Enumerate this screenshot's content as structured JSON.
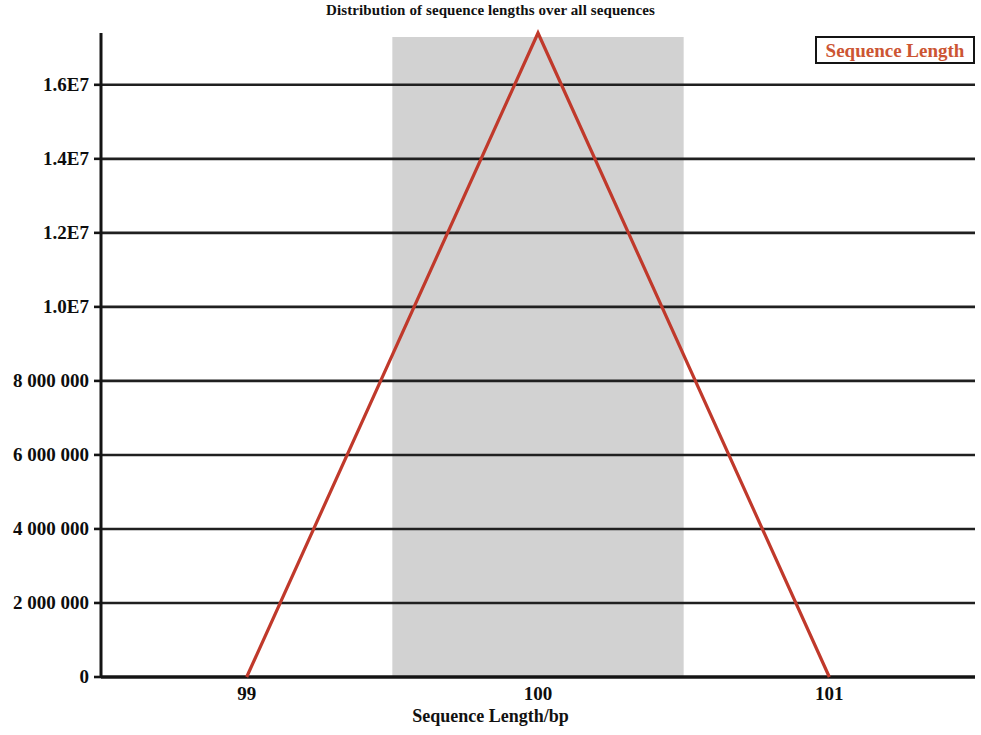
{
  "chart_data": {
    "type": "line",
    "title": "Distribution of sequence lengths over all sequences",
    "xlabel": "Sequence Length/bp",
    "ylabel": "",
    "xlim": [
      98.5,
      101.5
    ],
    "ylim": [
      0,
      17400000
    ],
    "grid": true,
    "legend_position": "top-right",
    "series": [
      {
        "name": "Sequence Length",
        "color": "#c0392b",
        "x": [
          99.0,
          100.0,
          101.0
        ],
        "values": [
          0,
          17400000,
          0
        ]
      }
    ],
    "x_ticks": [
      {
        "value": 99,
        "label": "99"
      },
      {
        "value": 100,
        "label": "100"
      },
      {
        "value": 101,
        "label": "101"
      }
    ],
    "y_ticks": [
      {
        "value": 16000000,
        "label": "1.6E7"
      },
      {
        "value": 14000000,
        "label": "1.4E7"
      },
      {
        "value": 12000000,
        "label": "1.2E7"
      },
      {
        "value": 10000000,
        "label": "1.0E7"
      },
      {
        "value": 8000000,
        "label": "8 000 000"
      },
      {
        "value": 6000000,
        "label": "6 000 000"
      },
      {
        "value": 4000000,
        "label": "4 000 000"
      },
      {
        "value": 2000000,
        "label": "2 000 000"
      },
      {
        "value": 0,
        "label": "0"
      }
    ],
    "highlight_band": {
      "from": 99.5,
      "to": 100.5,
      "color": "#d2d2d2"
    },
    "annotations": []
  },
  "legend": {
    "entries": [
      {
        "label": "Sequence Length",
        "color": "#cc5533"
      }
    ]
  },
  "colors": {
    "line": "#c0392b",
    "band": "#d2d2d2",
    "grid": "#202020",
    "axis": "#141414",
    "legend_text": "#cc5533",
    "background": "#ffffff"
  }
}
